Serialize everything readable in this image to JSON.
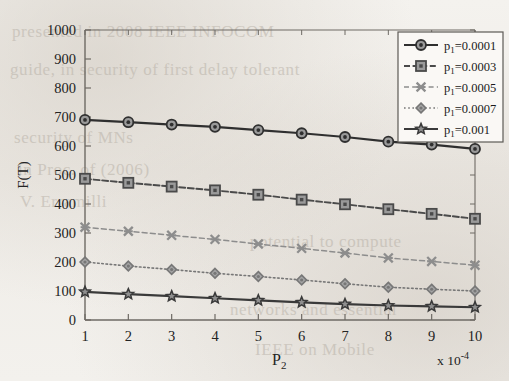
{
  "chart_data": {
    "type": "line",
    "title": "",
    "xlabel": "P2",
    "xlabel_html": "P<sub>2</sub>",
    "ylabel": "F(T)",
    "x_multiplier": "x 10-4",
    "x_multiplier_html": "x 10<sup>-4</sup>",
    "x": [
      1,
      2,
      3,
      4,
      5,
      6,
      7,
      8,
      9,
      10
    ],
    "xticklabels": [
      "1",
      "2",
      "3",
      "4",
      "5",
      "6",
      "7",
      "8",
      "9",
      "10"
    ],
    "yticklabels": [
      "0",
      "100",
      "200",
      "300",
      "400",
      "500",
      "600",
      "700",
      "800",
      "900",
      "1000"
    ],
    "xlim": [
      1,
      10
    ],
    "ylim": [
      0,
      1000
    ],
    "ytick_step": 100,
    "grid": false,
    "legend_position": "top-right",
    "series": [
      {
        "name": "p1=0.0001",
        "label_html": "p<sub>1</sub>=0.0001",
        "marker": "circle",
        "linestyle": "solid",
        "color": "#2f2f2f",
        "values": [
          690,
          682,
          674,
          666,
          655,
          644,
          631,
          615,
          605,
          590
        ]
      },
      {
        "name": "p1=0.0003",
        "label_html": "p<sub>1</sub>=0.0003",
        "marker": "square",
        "linestyle": "dashed",
        "color": "#4a4a4a",
        "values": [
          487,
          473,
          460,
          447,
          432,
          415,
          399,
          382,
          366,
          349
        ]
      },
      {
        "name": "p1=0.0005",
        "label_html": "p<sub>1</sub>=0.0005",
        "marker": "x",
        "linestyle": "dashed-light",
        "color": "#8d8d8d",
        "values": [
          320,
          306,
          292,
          278,
          262,
          247,
          231,
          214,
          202,
          189
        ]
      },
      {
        "name": "p1=0.0007",
        "label_html": "p<sub>1</sub>=0.0007",
        "marker": "diamond",
        "linestyle": "dotted",
        "color": "#777777",
        "values": [
          200,
          186,
          174,
          161,
          150,
          138,
          125,
          113,
          106,
          100
        ]
      },
      {
        "name": "p1=0.001",
        "label_html": "p<sub>1</sub>=0.001",
        "marker": "pentagram",
        "linestyle": "solid",
        "color": "#3a3a3a",
        "values": [
          97,
          89,
          82,
          75,
          68,
          61,
          55,
          50,
          47,
          44
        ]
      }
    ]
  },
  "background_bleed": [
    {
      "text": "presented in 2008 IEEE INFOCOM",
      "x": 12,
      "y": 22
    },
    {
      "text": "guide, in security of first delay tolerant",
      "x": 10,
      "y": 60
    },
    {
      "text": "security of MNs",
      "x": 14,
      "y": 128
    },
    {
      "text": "in Proc. of (2006)",
      "x": 18,
      "y": 160
    },
    {
      "text": "V. Erramilli",
      "x": 20,
      "y": 192
    },
    {
      "text": "potential to compute",
      "x": 250,
      "y": 232
    },
    {
      "text": "networks and essential",
      "x": 230,
      "y": 300
    },
    {
      "text": "IEEE on Mobile",
      "x": 255,
      "y": 340
    }
  ]
}
